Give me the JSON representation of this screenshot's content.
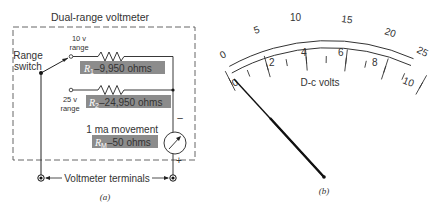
{
  "panel_a": {
    "title": "Dual-range voltmeter",
    "range_switch_label_1": "Range",
    "range_switch_label_2": "switch",
    "range_10_line1": "10 v",
    "range_10_line2": "range",
    "range_25_line1": "25 v",
    "range_25_line2": "range",
    "r1_sym": "R",
    "r1_sub": "1",
    "r1_value": "–9,950 ohms",
    "r2_sym": "R",
    "r2_sub": "2",
    "r2_value": "–24,950 ohms",
    "movement_label": "1 ma movement",
    "rm_sym": "R",
    "rm_sub": "M",
    "rm_value": "–50 ohms",
    "minus_sign": "–",
    "plus_sign": "+",
    "terminals_label": "Voltmeter terminals",
    "caption": "(a)",
    "highlight_color": "#8c8c8c"
  },
  "panel_b": {
    "outer_scale_labels": [
      "0",
      "5",
      "10",
      "15",
      "20",
      "25"
    ],
    "inner_scale_labels": [
      "0",
      "2",
      "4",
      "6",
      "8",
      "10"
    ],
    "scale_title": "D-c volts",
    "caption": "(b)",
    "needle_reading": "0"
  }
}
